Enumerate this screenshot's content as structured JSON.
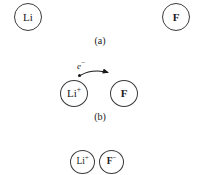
{
  "figure": {
    "ink_color": "#1a1a1a",
    "outline_color": "#3b3b3b",
    "background_color": "#ffffff"
  },
  "stages": {
    "a": {
      "caption": "(a)",
      "left_species": "Li",
      "right_species": "F"
    },
    "b": {
      "caption": "(b)",
      "left_species_symbol": "Li",
      "left_species_charge": "+",
      "right_species": "F",
      "electron_symbol": "e",
      "electron_charge": "−"
    },
    "c": {
      "left_species_symbol": "Li",
      "left_species_charge": "+",
      "right_species_symbol": "F",
      "right_species_charge": "−"
    }
  }
}
